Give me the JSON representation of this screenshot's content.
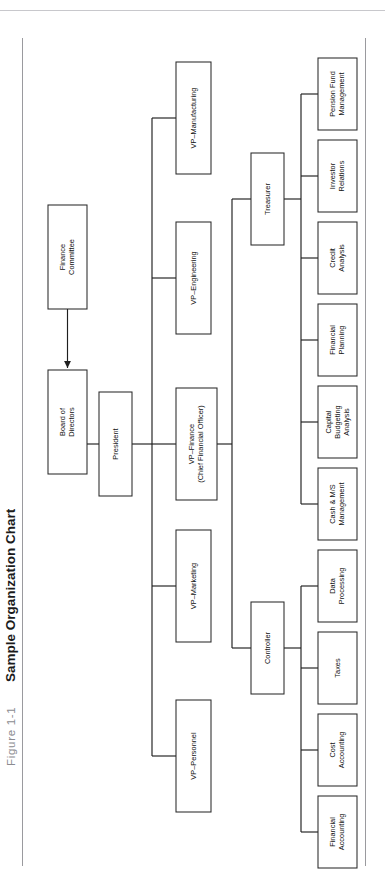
{
  "figure": {
    "label": "Figure 1-1",
    "title": "Sample Organization Chart"
  },
  "colors": {
    "box_stroke": "#2a2a2a",
    "link_stroke": "#1f1f1f",
    "page_background": "#ffffff",
    "rule": "#9a9a9e",
    "title_text": "#1b1b1b",
    "figure_label_text": "#8b8b90"
  },
  "chart_data": {
    "type": "diagram",
    "subtype": "organization-chart",
    "title": "Sample Organization Chart",
    "orientation": "rotated-90-left",
    "nodes": [
      {
        "id": "finance_committee",
        "label": "Finance Committee",
        "lines": [
          "Finance",
          "Committee"
        ],
        "level": 0
      },
      {
        "id": "board",
        "label": "Board of Directors",
        "lines": [
          "Board of",
          "Directors"
        ],
        "level": 1
      },
      {
        "id": "president",
        "label": "President",
        "lines": [
          "President"
        ],
        "level": 2
      },
      {
        "id": "vp_personnel",
        "label": "VP–Personnel",
        "lines": [
          "VP–Personnel"
        ],
        "level": 3
      },
      {
        "id": "vp_marketing",
        "label": "VP–Marketing",
        "lines": [
          "VP–Marketing"
        ],
        "level": 3
      },
      {
        "id": "vp_finance",
        "label": "VP–Finance (Chief Financial Officer)",
        "lines": [
          "VP–Finance",
          "(Chief Financial Officer)"
        ],
        "level": 3
      },
      {
        "id": "vp_engineering",
        "label": "VP–Engineering",
        "lines": [
          "VP–Engineering"
        ],
        "level": 3
      },
      {
        "id": "vp_manufacturing",
        "label": "VP–Manufacturing",
        "lines": [
          "VP–Manufacturing"
        ],
        "level": 3
      },
      {
        "id": "controller",
        "label": "Controller",
        "lines": [
          "Controller"
        ],
        "level": 4
      },
      {
        "id": "treasurer",
        "label": "Treasurer",
        "lines": [
          "Treasurer"
        ],
        "level": 4
      },
      {
        "id": "financial_accounting",
        "label": "Financial Accounting",
        "lines": [
          "Financial",
          "Accounting"
        ],
        "level": 5
      },
      {
        "id": "cost_accounting",
        "label": "Cost Accounting",
        "lines": [
          "Cost",
          "Accounting"
        ],
        "level": 5
      },
      {
        "id": "taxes",
        "label": "Taxes",
        "lines": [
          "Taxes"
        ],
        "level": 5
      },
      {
        "id": "data_processing",
        "label": "Data Processing",
        "lines": [
          "Data",
          "Processing"
        ],
        "level": 5
      },
      {
        "id": "cash_ms_management",
        "label": "Cash & M/S Management",
        "lines": [
          "Cash & M/S",
          "Management"
        ],
        "level": 5
      },
      {
        "id": "capital_budgeting",
        "label": "Capital Budgeting Analysis",
        "lines": [
          "Capital",
          "Budgeting",
          "Analysis"
        ],
        "level": 5
      },
      {
        "id": "financial_planning",
        "label": "Financial Planning",
        "lines": [
          "Financial",
          "Planning"
        ],
        "level": 5
      },
      {
        "id": "credit_analysis",
        "label": "Credit Analysis",
        "lines": [
          "Credit",
          "Analysis"
        ],
        "level": 5
      },
      {
        "id": "investor_relations",
        "label": "Investor Relations",
        "lines": [
          "Investor",
          "Relations"
        ],
        "level": 5
      },
      {
        "id": "pension_fund",
        "label": "Pension Fund Management",
        "lines": [
          "Pension Fund",
          "Management"
        ],
        "level": 5
      }
    ],
    "edges": [
      {
        "from": "finance_committee",
        "to": "board",
        "style": "arrow"
      },
      {
        "from": "board",
        "to": "president",
        "style": "plain"
      },
      {
        "from": "president",
        "to": "vp_personnel",
        "style": "plain"
      },
      {
        "from": "president",
        "to": "vp_marketing",
        "style": "plain"
      },
      {
        "from": "president",
        "to": "vp_finance",
        "style": "plain"
      },
      {
        "from": "president",
        "to": "vp_engineering",
        "style": "plain"
      },
      {
        "from": "president",
        "to": "vp_manufacturing",
        "style": "plain"
      },
      {
        "from": "vp_finance",
        "to": "controller",
        "style": "plain"
      },
      {
        "from": "vp_finance",
        "to": "treasurer",
        "style": "plain"
      },
      {
        "from": "controller",
        "to": "financial_accounting",
        "style": "plain"
      },
      {
        "from": "controller",
        "to": "cost_accounting",
        "style": "plain"
      },
      {
        "from": "controller",
        "to": "taxes",
        "style": "plain"
      },
      {
        "from": "controller",
        "to": "data_processing",
        "style": "plain"
      },
      {
        "from": "treasurer",
        "to": "cash_ms_management",
        "style": "plain"
      },
      {
        "from": "treasurer",
        "to": "capital_budgeting",
        "style": "plain"
      },
      {
        "from": "treasurer",
        "to": "financial_planning",
        "style": "plain"
      },
      {
        "from": "treasurer",
        "to": "credit_analysis",
        "style": "plain"
      },
      {
        "from": "treasurer",
        "to": "investor_relations",
        "style": "plain"
      },
      {
        "from": "treasurer",
        "to": "pension_fund",
        "style": "plain"
      }
    ]
  },
  "layout": {
    "boxes": {
      "finance_committee": {
        "x": 48,
        "y": 205,
        "w": 39,
        "h": 104
      },
      "board": {
        "x": 48,
        "y": 370,
        "w": 39,
        "h": 104
      },
      "president": {
        "x": 99,
        "y": 392,
        "w": 33,
        "h": 104
      },
      "vp_manufacturing": {
        "x": 176,
        "y": 62,
        "w": 35,
        "h": 112
      },
      "vp_engineering": {
        "x": 176,
        "y": 222,
        "w": 35,
        "h": 112
      },
      "vp_finance": {
        "x": 176,
        "y": 388,
        "w": 41,
        "h": 112
      },
      "vp_marketing": {
        "x": 176,
        "y": 530,
        "w": 35,
        "h": 112
      },
      "vp_personnel": {
        "x": 176,
        "y": 700,
        "w": 35,
        "h": 112
      },
      "treasurer": {
        "x": 251,
        "y": 153,
        "w": 33,
        "h": 92
      },
      "controller": {
        "x": 251,
        "y": 602,
        "w": 33,
        "h": 92
      },
      "pension_fund": {
        "x": 318,
        "y": 58,
        "w": 39,
        "h": 72
      },
      "investor_relations": {
        "x": 318,
        "y": 140,
        "w": 39,
        "h": 72
      },
      "credit_analysis": {
        "x": 318,
        "y": 222,
        "w": 39,
        "h": 72
      },
      "financial_planning": {
        "x": 318,
        "y": 304,
        "w": 39,
        "h": 72
      },
      "capital_budgeting": {
        "x": 318,
        "y": 386,
        "w": 39,
        "h": 72
      },
      "cash_ms_management": {
        "x": 318,
        "y": 468,
        "w": 39,
        "h": 72
      },
      "data_processing": {
        "x": 318,
        "y": 550,
        "w": 39,
        "h": 72
      },
      "taxes": {
        "x": 318,
        "y": 632,
        "w": 39,
        "h": 72
      },
      "cost_accounting": {
        "x": 318,
        "y": 714,
        "w": 39,
        "h": 72
      },
      "financial_accounting": {
        "x": 318,
        "y": 796,
        "w": 39,
        "h": 72
      }
    }
  }
}
